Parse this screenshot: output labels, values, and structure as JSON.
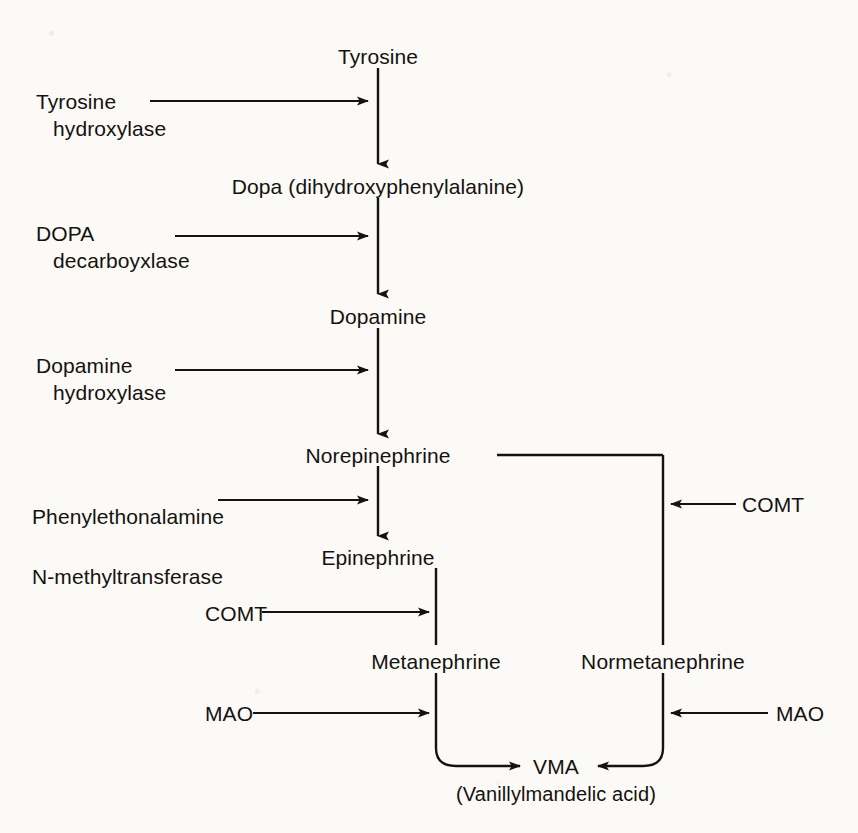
{
  "diagram": {
    "type": "flowchart",
    "ink_color": "#15120f",
    "background_color": "#fbfaf7"
  },
  "metabolites": [
    {
      "id": "tyrosine",
      "label": "Tyrosine",
      "x": 378,
      "y": 56,
      "align": "center"
    },
    {
      "id": "dopa",
      "label": "Dopa (dihydroxyphenylalanine)",
      "x": 378,
      "y": 186,
      "align": "center"
    },
    {
      "id": "dopamine",
      "label": "Dopamine",
      "x": 378,
      "y": 316,
      "align": "center"
    },
    {
      "id": "norepinephrine",
      "label": "Norepinephrine",
      "x": 378,
      "y": 455,
      "align": "center"
    },
    {
      "id": "epinephrine",
      "label": "Epinephrine",
      "x": 378,
      "y": 557,
      "align": "center"
    },
    {
      "id": "metanephrine",
      "label": "Metanephrine",
      "x": 436,
      "y": 661,
      "align": "center"
    },
    {
      "id": "normetanephrine",
      "label": "Normetanephrine",
      "x": 663,
      "y": 661,
      "align": "center"
    },
    {
      "id": "vma",
      "label": "VMA",
      "x": 556,
      "y": 766,
      "align": "center"
    }
  ],
  "caption": {
    "id": "vma-fullname",
    "label": "(Vanillylmandelic acid)",
    "x": 556,
    "y": 795
  },
  "enzymes": [
    {
      "id": "tyrosine-hydroxylase",
      "line1": "Tyrosine",
      "line2": "hydroxylase",
      "x": 36,
      "y": 88,
      "indent": true
    },
    {
      "id": "dopa-decarboxylase",
      "line1": "DOPA",
      "line2": "decarboyxlase",
      "x": 36,
      "y": 220,
      "indent": true
    },
    {
      "id": "dopamine-hydroxylase",
      "line1": "Dopamine",
      "line2": "hydroxylase",
      "x": 36,
      "y": 352,
      "indent": true
    },
    {
      "id": "pnmt",
      "line1": "Phenylethonalamine",
      "line2": "N-methyltransferase",
      "x": 32,
      "y": 487,
      "indent": false
    },
    {
      "id": "comt-right",
      "line1": "COMT",
      "line2": "",
      "x": 742,
      "y": 491,
      "indent": false
    },
    {
      "id": "comt-left",
      "line1": "COMT",
      "line2": "",
      "x": 205,
      "y": 600,
      "indent": false
    },
    {
      "id": "mao-left",
      "line1": "MAO",
      "line2": "",
      "x": 205,
      "y": 700,
      "indent": false
    },
    {
      "id": "mao-right",
      "line1": "MAO",
      "line2": "",
      "x": 776,
      "y": 700,
      "indent": false
    }
  ],
  "connectors": {
    "main_column_x": 378,
    "metanephrine_column_x": 436,
    "normetanephrine_column_x": 663,
    "vertical_arrows": [
      {
        "id": "tyrosine-to-dopa",
        "x": 378,
        "y1": 68,
        "y2": 166
      },
      {
        "id": "dopa-to-dopamine",
        "x": 378,
        "y1": 198,
        "y2": 296
      },
      {
        "id": "dopamine-to-norepinephrine",
        "x": 378,
        "y1": 328,
        "y2": 436
      },
      {
        "id": "norepinephrine-to-epinephrine",
        "x": 378,
        "y1": 466,
        "y2": 538
      }
    ],
    "plain_segments": [
      {
        "id": "epinephrine-to-metanephrine",
        "x": 436,
        "y1": 568,
        "y2": 645
      },
      {
        "id": "norepi-branch-down-to-normetanephrine",
        "x": 663,
        "y1": 455,
        "y2": 645
      },
      {
        "id": "norepi-branch-horizontal",
        "y": 455,
        "x1": 497,
        "x2": 663
      },
      {
        "id": "metanephrine-down",
        "x": 436,
        "y1": 673,
        "y2": 745
      },
      {
        "id": "normetanephrine-down",
        "x": 663,
        "y1": 673,
        "y2": 745
      }
    ],
    "enzyme_arrows": [
      {
        "id": "tyrosine-hydroxylase-arrow",
        "x1": 150,
        "x2": 370,
        "y": 101,
        "dir": "right"
      },
      {
        "id": "dopa-decarboxylase-arrow",
        "x1": 175,
        "x2": 370,
        "y": 236,
        "dir": "right"
      },
      {
        "id": "dopamine-hydroxylase-arrow",
        "x1": 175,
        "x2": 370,
        "y": 370,
        "dir": "right"
      },
      {
        "id": "pnmt-arrow",
        "x1": 218,
        "x2": 370,
        "y": 500,
        "dir": "right"
      },
      {
        "id": "comt-right-arrow",
        "x1": 736,
        "x2": 670,
        "y": 504,
        "dir": "left"
      },
      {
        "id": "comt-left-arrow",
        "x1": 262,
        "x2": 430,
        "y": 612,
        "dir": "right"
      },
      {
        "id": "mao-left-arrow",
        "x1": 253,
        "x2": 430,
        "y": 713,
        "dir": "right"
      },
      {
        "id": "mao-right-arrow",
        "x1": 768,
        "x2": 670,
        "y": 713,
        "dir": "left"
      }
    ],
    "vma_inflows": [
      {
        "id": "metanephrine-to-vma",
        "from": "metanephrine",
        "corner": "bottom-left-round",
        "dir": "right"
      },
      {
        "id": "normetanephrine-to-vma",
        "from": "normetanephrine",
        "corner": "bottom-right-round",
        "dir": "left"
      }
    ]
  }
}
